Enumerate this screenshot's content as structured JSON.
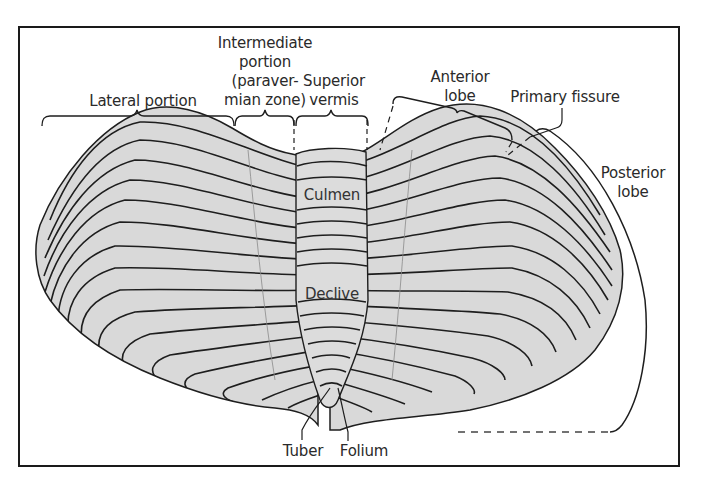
{
  "figure": {
    "colors": {
      "frame": "#1a1a1a",
      "lobe_fill": "#d9d9d9",
      "folia_lines": "#1e1e1e",
      "label_text": "#2a2a2a"
    }
  },
  "labels": {
    "lateral_portion": "Lateral portion",
    "intermediate_portion": [
      "Intermediate",
      "portion",
      "(paraver-",
      "mian zone)"
    ],
    "superior_vermis": [
      "Superior",
      "vermis"
    ],
    "anterior_lobe": [
      "Anterior",
      "lobe"
    ],
    "primary_fissure": "Primary fissure",
    "posterior_lobe": [
      "Posterior",
      "lobe"
    ],
    "culmen": "Culmen",
    "declive": "Declive",
    "tuber": "Tuber",
    "folium": "Folium"
  }
}
